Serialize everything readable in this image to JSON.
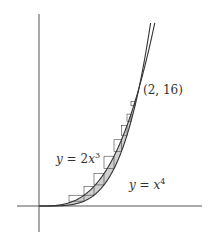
{
  "figure": {
    "curve_upper": {
      "label_y": "y",
      "label_eq": "=",
      "label_coef": "2",
      "label_var": "x",
      "label_exp": "3",
      "expression": "y = 2x^3"
    },
    "curve_lower": {
      "label_y": "y",
      "label_eq": "=",
      "label_var": "x",
      "label_exp": "4",
      "expression": "y = x^4"
    },
    "intersection_label": "(2, 16)",
    "colors": {
      "axis": "#555555",
      "curve": "#333333",
      "shading": "#cfcfcf",
      "strip": "#444444"
    }
  }
}
